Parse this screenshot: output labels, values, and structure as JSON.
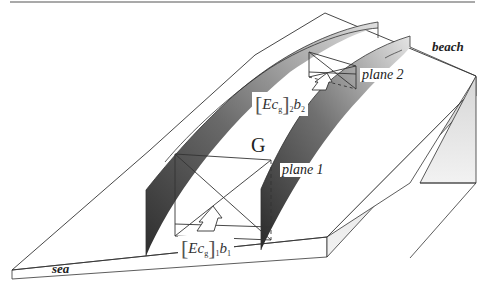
{
  "figure": {
    "type": "3d-schematic",
    "labels": {
      "sea": "sea",
      "beach": "beach",
      "plane1": "plane 1",
      "plane2": "plane 2",
      "region": "G"
    },
    "flux1": {
      "symbol": "Ec",
      "sub_g": "g",
      "index": "1",
      "b": "b",
      "b_index": "1"
    },
    "flux2": {
      "symbol": "Ec",
      "sub_g": "g",
      "index": "2",
      "b": "b",
      "b_index": "2"
    },
    "colors": {
      "line": "#333333",
      "bar_dark": "#3a3a3a",
      "bar_light": "#d8d8d8",
      "side_face": "#e6e6e6",
      "background": "#ffffff"
    }
  }
}
